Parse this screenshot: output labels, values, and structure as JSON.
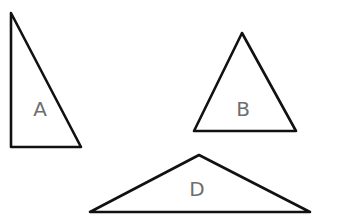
{
  "diagram": {
    "stroke_color": "#111111",
    "label_color": "#6e6e6e",
    "shapes": [
      {
        "id": "A",
        "label": "A",
        "type": "right-triangle",
        "points": "11,13 11,147 81,147",
        "label_pos": [
          40,
          116
        ]
      },
      {
        "id": "B",
        "label": "B",
        "type": "isosceles-triangle",
        "points": "242,33 194,131 296,131",
        "label_pos": [
          243,
          116
        ]
      },
      {
        "id": "D",
        "label": "D",
        "type": "obtuse-triangle",
        "points": "199,155 90,212 310,212",
        "label_pos": [
          197,
          196
        ]
      }
    ]
  }
}
